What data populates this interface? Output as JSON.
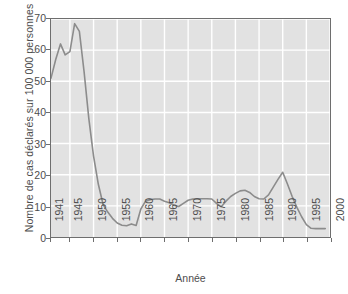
{
  "chart_data": {
    "type": "line",
    "title": "",
    "xlabel": "Année",
    "ylabel": "Nombre de cas déclarés sur 100 000 personnes",
    "xlim": [
      1941,
      2000
    ],
    "ylim": [
      0,
      70
    ],
    "grid": true,
    "legend": false,
    "xticks": [
      "1941",
      "1945",
      "1950",
      "1955",
      "1960",
      "1965",
      "1970",
      "1975",
      "1980",
      "1985",
      "1990",
      "1995",
      "2000"
    ],
    "xtick_values": [
      1941,
      1945,
      1950,
      1955,
      1960,
      1965,
      1970,
      1975,
      1980,
      1985,
      1990,
      1995,
      2000
    ],
    "yticks": [
      "0",
      "10",
      "20",
      "30",
      "40",
      "50",
      "60",
      "70"
    ],
    "ytick_values": [
      0,
      10,
      20,
      30,
      40,
      50,
      60,
      70
    ],
    "line_color": "#8c8c8c",
    "plot_background": "#e2e2e2",
    "gridline_color": "#ffffff",
    "axis_color": "#6e6e6e",
    "series": [
      {
        "name": "Cas déclarés",
        "x": [
          1941,
          1942,
          1943,
          1944,
          1945,
          1946,
          1947,
          1948,
          1949,
          1950,
          1951,
          1952,
          1953,
          1954,
          1955,
          1956,
          1957,
          1958,
          1959,
          1960,
          1961,
          1962,
          1963,
          1964,
          1965,
          1966,
          1967,
          1968,
          1969,
          1970,
          1971,
          1972,
          1973,
          1974,
          1975,
          1976,
          1977,
          1978,
          1979,
          1980,
          1981,
          1982,
          1983,
          1984,
          1985,
          1986,
          1987,
          1988,
          1989,
          1990,
          1991,
          1992,
          1993,
          1994,
          1995,
          1996,
          1997,
          1998,
          1999
        ],
        "y": [
          51,
          57,
          62,
          58.5,
          59.5,
          68.5,
          66,
          53,
          38,
          26,
          17,
          10.5,
          8,
          6,
          4.5,
          3.8,
          3.6,
          4.2,
          3.7,
          9,
          11.5,
          12,
          12.2,
          12.2,
          11.5,
          11,
          10.2,
          9.8,
          10.8,
          11.8,
          12.2,
          12.3,
          12.3,
          12.3,
          12.2,
          10.8,
          9.7,
          11.5,
          13,
          14,
          14.8,
          15,
          14.3,
          13,
          12.3,
          12.2,
          13.5,
          16,
          18.5,
          20.8,
          17,
          13,
          9.5,
          6.5,
          4,
          2.8,
          2.7,
          2.7,
          2.7
        ]
      }
    ]
  }
}
